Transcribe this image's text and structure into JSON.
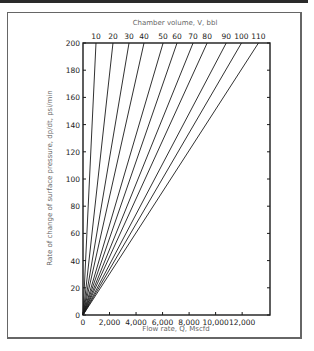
{
  "chart_data": {
    "type": "line",
    "title": "",
    "top_axis_title": "Chamber volume, V, bbl",
    "xlabel": "Flow rate, Q, Mscfd",
    "ylabel": "Rate of change of surface pressure, dp/dt, psi/min",
    "xlim": [
      0,
      14100
    ],
    "ylim": [
      0,
      200
    ],
    "x_ticks": [
      0,
      2000,
      4000,
      6000,
      8000,
      10000,
      12000
    ],
    "x_tick_labels": [
      "0",
      "2,000",
      "4,000",
      "6,000",
      "8,000",
      "10,000",
      "12,000"
    ],
    "y_ticks": [
      0,
      20,
      40,
      60,
      80,
      100,
      120,
      140,
      160,
      180,
      200
    ],
    "y_tick_labels": [
      "0",
      "20",
      "40",
      "60",
      "80",
      "100",
      "120",
      "140",
      "160",
      "180",
      "200"
    ],
    "grid": false,
    "legend": "none (lines labeled along top axis)",
    "series": [
      {
        "name": "10",
        "x": [
          0,
          980
        ],
        "y": [
          0,
          200
        ]
      },
      {
        "name": "20",
        "x": [
          0,
          2260
        ],
        "y": [
          0,
          200
        ]
      },
      {
        "name": "30",
        "x": [
          0,
          3470
        ],
        "y": [
          0,
          200
        ]
      },
      {
        "name": "40",
        "x": [
          0,
          4600
        ],
        "y": [
          0,
          200
        ]
      },
      {
        "name": "50",
        "x": [
          0,
          6040
        ],
        "y": [
          0,
          200
        ]
      },
      {
        "name": "60",
        "x": [
          0,
          7090
        ],
        "y": [
          0,
          200
        ]
      },
      {
        "name": "70",
        "x": [
          0,
          8300
        ],
        "y": [
          0,
          200
        ]
      },
      {
        "name": "80",
        "x": [
          0,
          9360
        ],
        "y": [
          0,
          200
        ]
      },
      {
        "name": "90",
        "x": [
          0,
          10800
        ],
        "y": [
          0,
          200
        ]
      },
      {
        "name": "100",
        "x": [
          0,
          11950
        ],
        "y": [
          0,
          200
        ]
      },
      {
        "name": "110",
        "x": [
          0,
          13230
        ],
        "y": [
          0,
          200
        ]
      }
    ]
  },
  "colors": {
    "line": "#1a1a1a",
    "axis": "#1a1a1a",
    "title_text": "#666666"
  }
}
